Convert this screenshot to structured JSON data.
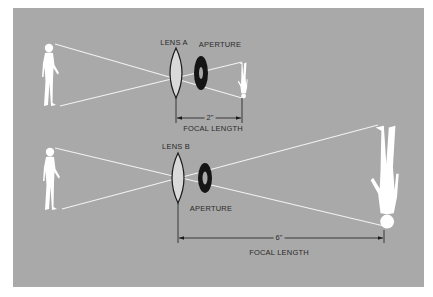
{
  "diagram": {
    "title": "",
    "colors": {
      "background": "#ffffff",
      "panel": "#a9a9a9",
      "figure": "#ffffff",
      "ray": "#f2f2f2",
      "lens_fill": "#d9d9d9",
      "lens_stroke": "#1a1a1a",
      "aperture": "#151515",
      "text": "#2a2a2a"
    },
    "top": {
      "lens_label": "LENS A",
      "aperture_label": "APERTURE",
      "dimension_value": "2\"",
      "dimension_label": "FOCAL LENGTH"
    },
    "bottom": {
      "lens_label": "LENS B",
      "aperture_label": "APERTURE",
      "dimension_value": "6\"",
      "dimension_label": "FOCAL LENGTH"
    }
  }
}
